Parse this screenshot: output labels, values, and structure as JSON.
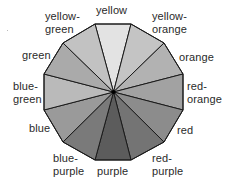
{
  "diagram": {
    "title": "",
    "type": "color-wheel",
    "center_point": "black-dot",
    "segments": [
      {
        "name": "yellow",
        "label_lines": [
          "yellow"
        ],
        "shade": "#e3e3e3"
      },
      {
        "name": "yellow-orange",
        "label_lines": [
          "yellow-",
          "orange"
        ],
        "shade": "#c4c4c4"
      },
      {
        "name": "orange",
        "label_lines": [
          "orange"
        ],
        "shade": "#b2b2b2"
      },
      {
        "name": "red-orange",
        "label_lines": [
          "red-",
          "orange"
        ],
        "shade": "#a2a2a2"
      },
      {
        "name": "red",
        "label_lines": [
          "red"
        ],
        "shade": "#8c8c8c"
      },
      {
        "name": "red-purple",
        "label_lines": [
          "red-",
          "purple"
        ],
        "shade": "#747474"
      },
      {
        "name": "purple",
        "label_lines": [
          "purple"
        ],
        "shade": "#5c5c5c"
      },
      {
        "name": "blue-purple",
        "label_lines": [
          "blue-",
          "purple"
        ],
        "shade": "#7a7a7a"
      },
      {
        "name": "blue",
        "label_lines": [
          "blue"
        ],
        "shade": "#9a9a9a"
      },
      {
        "name": "blue-green",
        "label_lines": [
          "blue-",
          "green"
        ],
        "shade": "#bababa"
      },
      {
        "name": "green",
        "label_lines": [
          "green"
        ],
        "shade": "#aaaaaa"
      },
      {
        "name": "yellow-green",
        "label_lines": [
          "yellow-",
          "green"
        ],
        "shade": "#c2c2c2"
      }
    ],
    "edge_color": "#1a1a1a"
  }
}
